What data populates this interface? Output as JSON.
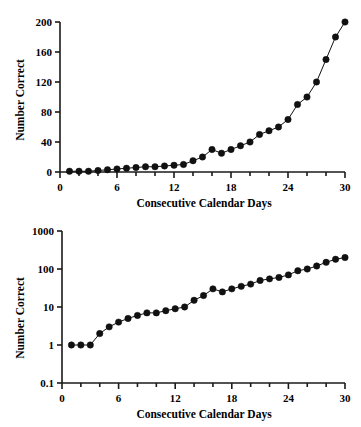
{
  "figure": {
    "panels": [
      {
        "id": "panel-linear",
        "xlabel": "Consecutive Calendar Days",
        "ylabel": "Number Correct",
        "xticks": [
          "0",
          "6",
          "12",
          "18",
          "24",
          "30"
        ],
        "yticks": [
          "0",
          "40",
          "80",
          "120",
          "160",
          "200"
        ]
      },
      {
        "id": "panel-log",
        "xlabel": "Consecutive Calendar Days",
        "ylabel": "Number Correct",
        "xticks": [
          "0",
          "6",
          "12",
          "18",
          "24",
          "30"
        ],
        "yticks": [
          "0.1",
          "1",
          "10",
          "100",
          "1000"
        ]
      }
    ]
  },
  "chart_data": [
    {
      "type": "line",
      "title": "",
      "xlabel": "Consecutive Calendar Days",
      "ylabel": "Number Correct",
      "xscale": "linear",
      "yscale": "linear",
      "xlim": [
        0,
        30
      ],
      "ylim": [
        0,
        200
      ],
      "xticks": [
        0,
        6,
        12,
        18,
        24,
        30
      ],
      "xminor_step": 2,
      "yticks": [
        0,
        40,
        80,
        120,
        160,
        200
      ],
      "grid": false,
      "legend": null,
      "marker": "filled-circle",
      "color": "#111111",
      "series": [
        {
          "name": "Number Correct",
          "x": [
            1,
            2,
            3,
            4,
            5,
            6,
            7,
            8,
            9,
            10,
            11,
            12,
            13,
            14,
            15,
            16,
            17,
            18,
            19,
            20,
            21,
            22,
            23,
            24,
            25,
            26,
            27,
            28,
            29,
            30
          ],
          "values": [
            1,
            1,
            1,
            2,
            3,
            4,
            5,
            6,
            7,
            7,
            8,
            9,
            10,
            15,
            20,
            30,
            25,
            30,
            35,
            40,
            50,
            55,
            60,
            70,
            90,
            100,
            120,
            150,
            180,
            200
          ]
        }
      ]
    },
    {
      "type": "line",
      "title": "",
      "xlabel": "Consecutive Calendar Days",
      "ylabel": "Number Correct",
      "xscale": "linear",
      "yscale": "log",
      "xlim": [
        0,
        30
      ],
      "ylim": [
        0.1,
        1000
      ],
      "xticks": [
        0,
        6,
        12,
        18,
        24,
        30
      ],
      "xminor_step": 2,
      "yticks": [
        0.1,
        1,
        10,
        100,
        1000
      ],
      "grid": false,
      "legend": null,
      "marker": "filled-circle",
      "color": "#111111",
      "series": [
        {
          "name": "Number Correct",
          "x": [
            1,
            2,
            3,
            4,
            5,
            6,
            7,
            8,
            9,
            10,
            11,
            12,
            13,
            14,
            15,
            16,
            17,
            18,
            19,
            20,
            21,
            22,
            23,
            24,
            25,
            26,
            27,
            28,
            29,
            30
          ],
          "values": [
            1,
            1,
            1,
            2,
            3,
            4,
            5,
            6,
            7,
            7,
            8,
            9,
            10,
            15,
            20,
            30,
            25,
            30,
            35,
            40,
            50,
            55,
            60,
            70,
            90,
            100,
            120,
            150,
            180,
            200
          ]
        }
      ]
    }
  ]
}
